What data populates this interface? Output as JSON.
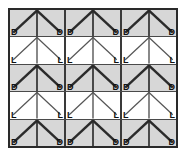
{
  "figure": {
    "grid": {
      "rows": 5,
      "groups_per_row": 3,
      "cells_per_group": 2
    },
    "colors": {
      "dark_row_background": "#d7d7d7",
      "light_row_background": "#ffffff",
      "outer_border": "#2a2a2a",
      "group_divider": "#3a3a3a",
      "row_divider": "#4a4a4a",
      "line_dark": "#2b2b2b",
      "line_light": "#555555",
      "label_color": "#111111"
    },
    "rows": [
      {
        "index": 0,
        "kind": "dark",
        "line_weight": "thick",
        "groups": [
          {
            "label_left": "D",
            "label_right": "D"
          },
          {
            "label_left": "D",
            "label_right": "D"
          },
          {
            "label_left": "D",
            "label_right": "D"
          }
        ]
      },
      {
        "index": 1,
        "kind": "light",
        "line_weight": "thin",
        "groups": [
          {
            "label_left": "L",
            "label_right": "L"
          },
          {
            "label_left": "L",
            "label_right": "L"
          },
          {
            "label_left": "L",
            "label_right": "L"
          }
        ]
      },
      {
        "index": 2,
        "kind": "dark",
        "line_weight": "thick",
        "groups": [
          {
            "label_left": "D",
            "label_right": "D"
          },
          {
            "label_left": "D",
            "label_right": "D"
          },
          {
            "label_left": "D",
            "label_right": "D"
          }
        ]
      },
      {
        "index": 3,
        "kind": "light",
        "line_weight": "thin",
        "groups": [
          {
            "label_left": "L",
            "label_right": "L"
          },
          {
            "label_left": "L",
            "label_right": "L"
          },
          {
            "label_left": "L",
            "label_right": "L"
          }
        ]
      },
      {
        "index": 4,
        "kind": "dark",
        "line_weight": "thick",
        "groups": [
          {
            "label_left": "D",
            "label_right": "D"
          },
          {
            "label_left": "D",
            "label_right": "D"
          },
          {
            "label_left": "D",
            "label_right": "D"
          }
        ]
      }
    ]
  }
}
